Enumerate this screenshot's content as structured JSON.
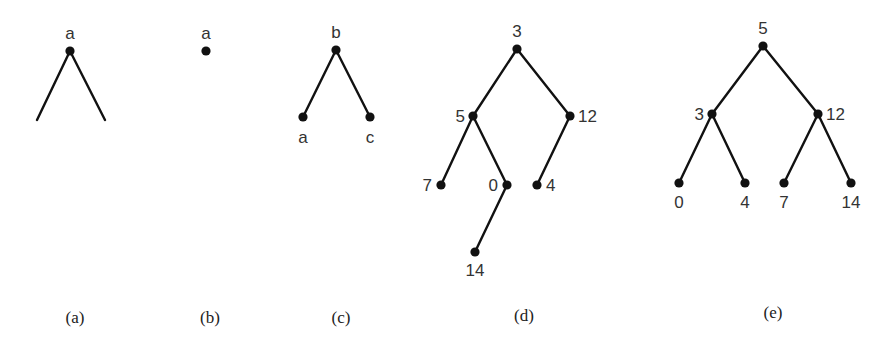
{
  "figure": {
    "panels": [
      {
        "id": "a",
        "caption": "(a)",
        "nodes": [
          {
            "id": "a",
            "label": "a",
            "x": 70,
            "y": 51,
            "lx": 70,
            "ly": 39,
            "anchor": "middle"
          }
        ],
        "dangling_edges": [
          {
            "from": "a",
            "x2": 37,
            "y2": 120
          },
          {
            "from": "a",
            "x2": 105,
            "y2": 120
          }
        ],
        "edges": []
      },
      {
        "id": "b",
        "caption": "(b)",
        "nodes": [
          {
            "id": "a",
            "label": "a",
            "x": 206,
            "y": 51,
            "lx": 206,
            "ly": 39,
            "anchor": "middle"
          }
        ],
        "dangling_edges": [],
        "edges": []
      },
      {
        "id": "c",
        "caption": "(c)",
        "nodes": [
          {
            "id": "b",
            "label": "b",
            "x": 336,
            "y": 50,
            "lx": 336,
            "ly": 38,
            "anchor": "middle"
          },
          {
            "id": "a",
            "label": "a",
            "x": 303,
            "y": 117,
            "lx": 303,
            "ly": 143,
            "anchor": "middle"
          },
          {
            "id": "c",
            "label": "c",
            "x": 370,
            "y": 117,
            "lx": 370,
            "ly": 143,
            "anchor": "middle"
          }
        ],
        "dangling_edges": [],
        "edges": [
          [
            "b",
            "a"
          ],
          [
            "b",
            "c"
          ]
        ]
      },
      {
        "id": "d",
        "caption": "(d)",
        "nodes": [
          {
            "id": "3",
            "label": "3",
            "x": 517,
            "y": 49,
            "lx": 517,
            "ly": 37,
            "anchor": "middle"
          },
          {
            "id": "5",
            "label": "5",
            "x": 473,
            "y": 116,
            "lx": 465,
            "ly": 122,
            "anchor": "end"
          },
          {
            "id": "12",
            "label": "12",
            "x": 570,
            "y": 116,
            "lx": 578,
            "ly": 122,
            "anchor": "start"
          },
          {
            "id": "7",
            "label": "7",
            "x": 441,
            "y": 185,
            "lx": 432,
            "ly": 191,
            "anchor": "end"
          },
          {
            "id": "0",
            "label": "0",
            "x": 507,
            "y": 185,
            "lx": 498,
            "ly": 191,
            "anchor": "end"
          },
          {
            "id": "4",
            "label": "4",
            "x": 537,
            "y": 185,
            "lx": 546,
            "ly": 191,
            "anchor": "start"
          },
          {
            "id": "14",
            "label": "14",
            "x": 475,
            "y": 252,
            "lx": 475,
            "ly": 276,
            "anchor": "middle"
          }
        ],
        "dangling_edges": [],
        "edges": [
          [
            "3",
            "5"
          ],
          [
            "3",
            "12"
          ],
          [
            "5",
            "7"
          ],
          [
            "5",
            "0"
          ],
          [
            "12",
            "4"
          ],
          [
            "0",
            "14"
          ]
        ]
      },
      {
        "id": "e",
        "caption": "(e)",
        "nodes": [
          {
            "id": "5",
            "label": "5",
            "x": 763,
            "y": 46,
            "lx": 763,
            "ly": 34,
            "anchor": "middle"
          },
          {
            "id": "3",
            "label": "3",
            "x": 712,
            "y": 114,
            "lx": 704,
            "ly": 120,
            "anchor": "end"
          },
          {
            "id": "12",
            "label": "12",
            "x": 818,
            "y": 114,
            "lx": 826,
            "ly": 120,
            "anchor": "start"
          },
          {
            "id": "0",
            "label": "0",
            "x": 679,
            "y": 183,
            "lx": 679,
            "ly": 208,
            "anchor": "middle"
          },
          {
            "id": "4",
            "label": "4",
            "x": 745,
            "y": 183,
            "lx": 745,
            "ly": 208,
            "anchor": "middle"
          },
          {
            "id": "7",
            "label": "7",
            "x": 784,
            "y": 183,
            "lx": 784,
            "ly": 208,
            "anchor": "middle"
          },
          {
            "id": "14",
            "label": "14",
            "x": 851,
            "y": 183,
            "lx": 851,
            "ly": 208,
            "anchor": "middle"
          }
        ],
        "dangling_edges": [],
        "edges": [
          [
            "5",
            "3"
          ],
          [
            "5",
            "12"
          ],
          [
            "3",
            "0"
          ],
          [
            "3",
            "4"
          ],
          [
            "12",
            "7"
          ],
          [
            "12",
            "14"
          ]
        ]
      }
    ],
    "captions": [
      {
        "text": "(a)",
        "x": 75,
        "y": 323
      },
      {
        "text": "(b)",
        "x": 210,
        "y": 323
      },
      {
        "text": "(c)",
        "x": 341,
        "y": 323
      },
      {
        "text": "(d)",
        "x": 524,
        "y": 321
      },
      {
        "text": "(e)",
        "x": 773,
        "y": 318
      }
    ]
  }
}
